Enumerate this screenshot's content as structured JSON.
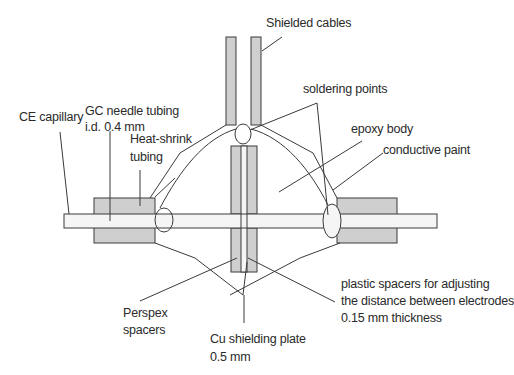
{
  "diagram": {
    "labels": {
      "shielded_cables": "Shielded cables",
      "soldering_points": "soldering points",
      "ce_capillary": "CE capillary",
      "gc_needle_line1": "GC needle tubing",
      "gc_needle_line2": "i.d. 0.4 mm",
      "heat_shrink_line1": "Heat-shrink",
      "heat_shrink_line2": "tubing",
      "epoxy_body": "epoxy body",
      "conductive_paint": "conductive paint",
      "plastic_spacers_line1": "plastic spacers for adjusting",
      "plastic_spacers_line2": "the distance between electrodes",
      "plastic_spacers_line3": "0.15 mm thickness",
      "perspex_line1": "Perspex",
      "perspex_line2": "spacers",
      "cu_plate_line1": "Cu shielding plate",
      "cu_plate_line2": "0.5 mm"
    },
    "colors": {
      "component_fill": "#cfcfcf",
      "capillary_fill": "#f5f5f5",
      "stroke": "#3a3a3a",
      "text": "#2a2a2a"
    }
  }
}
